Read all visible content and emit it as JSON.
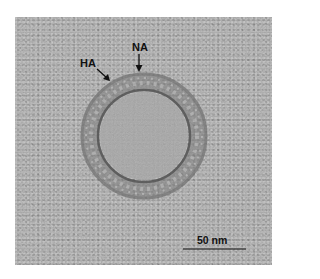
{
  "figure": {
    "labels": {
      "ha": "HA",
      "na": "NA"
    },
    "scale_bar": {
      "label": "50 nm",
      "length_px": 63
    },
    "colors": {
      "background": "#a9a9a9",
      "membrane": "#5a5a5a",
      "interior": "#a4a4a4",
      "text": "#111111"
    }
  }
}
